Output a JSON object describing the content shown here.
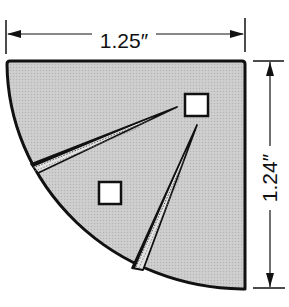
{
  "diagram": {
    "type": "quarter-circle part with dimension callouts",
    "width_dimension": {
      "label": "1.25″",
      "value": 1.25,
      "unit": "inch"
    },
    "height_dimension": {
      "label": "1.24″",
      "value": 1.24,
      "unit": "inch"
    },
    "features": {
      "square_holes": 2,
      "wedge_grooves": 2
    },
    "colors": {
      "fill": "#c9c9c9",
      "outline": "#111111",
      "background": "#ffffff",
      "hole": "#ffffff"
    }
  }
}
